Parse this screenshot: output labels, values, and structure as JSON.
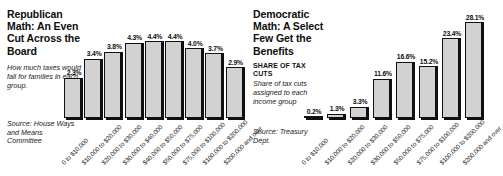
{
  "chart_data": [
    {
      "type": "bar",
      "panel": "left",
      "title": "Republican Math: An Even Cut Across the Board",
      "blurb": "How much taxes would fall for families in each group.",
      "source": "Source: House Ways and Means Committee",
      "xlabel": "",
      "ylabel": "",
      "ylim": [
        0,
        4.8
      ],
      "grid": false,
      "legend": "none",
      "categories": [
        "0 to $10,000",
        "$10,000 to $20,000",
        "$20,000 to $30,000",
        "$30,000 to $40,000",
        "$40,000 to $50,000",
        "$50,000 to $75,000",
        "$75,000 to $100,000",
        "$100,000 to $200,000",
        "$200,000 and over"
      ],
      "values": [
        2.3,
        3.4,
        3.8,
        4.3,
        4.4,
        4.4,
        4.0,
        3.7,
        2.9
      ],
      "value_labels": [
        "2.3%",
        "3.4%",
        "3.8%",
        "4.3%",
        "4.4%",
        "4.4%",
        "4.0%",
        "3.7%",
        "2.9%"
      ]
    },
    {
      "type": "bar",
      "panel": "right",
      "title": "Democratic Math: A Select Few Get the Benefits",
      "kicker": "SHARE OF TAX CUTS",
      "blurb": "Share of tax cuts assigned to each income group",
      "source": "Source: Treasury Dept.",
      "xlabel": "",
      "ylabel": "",
      "ylim": [
        0,
        30
      ],
      "grid": false,
      "legend": "none",
      "categories": [
        "0 to $10,000",
        "$10,000 to $20,000",
        "$20,000 to $30,000",
        "$30,000 to $50,000",
        "$50,000 to $75,000",
        "$75,000 to $100,000",
        "$100,000 to $200,000",
        "$200,000 and over"
      ],
      "values": [
        0.2,
        1.3,
        3.3,
        11.6,
        16.6,
        15.2,
        23.4,
        28.1
      ],
      "value_labels": [
        "0.2%",
        "1.3%",
        "3.3%",
        "11.6%",
        "16.6%",
        "15.2%",
        "23.4%",
        "28.1%"
      ]
    }
  ],
  "colors": {
    "bar_fill": "#d2d2d2",
    "bar_outline": "#101010",
    "text": "#0d0d0d",
    "background": "#ffffff"
  }
}
